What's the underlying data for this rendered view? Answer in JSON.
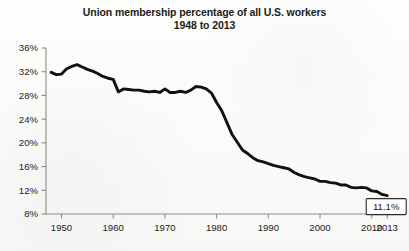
{
  "chart_data": {
    "type": "line",
    "title": "Union membership percentage of all U.S. workers",
    "subtitle": "1948 to 2013",
    "xlabel": "",
    "ylabel": "",
    "xlim": [
      1947,
      2013
    ],
    "ylim": [
      8,
      36
    ],
    "grid": false,
    "legend": "none",
    "line_color": "#111111",
    "x_ticks": [
      "1950",
      "1960",
      "1970",
      "1980",
      "1990",
      "2000",
      "2010",
      "2013"
    ],
    "x_tick_values": [
      1950,
      1960,
      1970,
      1980,
      1990,
      2000,
      2010,
      2013
    ],
    "y_ticks": [
      "8%",
      "12%",
      "16%",
      "20%",
      "24%",
      "28%",
      "32%",
      "36%"
    ],
    "y_tick_values": [
      8,
      12,
      16,
      20,
      24,
      28,
      32,
      36
    ],
    "annotation": {
      "label": "11.1%",
      "x": 2013,
      "y": 11.1
    },
    "x": [
      1948,
      1949,
      1950,
      1951,
      1952,
      1953,
      1954,
      1955,
      1956,
      1957,
      1958,
      1959,
      1960,
      1961,
      1962,
      1963,
      1964,
      1965,
      1966,
      1967,
      1968,
      1969,
      1970,
      1971,
      1972,
      1973,
      1974,
      1975,
      1976,
      1977,
      1978,
      1979,
      1980,
      1981,
      1982,
      1983,
      1984,
      1985,
      1986,
      1987,
      1988,
      1989,
      1990,
      1991,
      1992,
      1993,
      1994,
      1995,
      1996,
      1997,
      1998,
      1999,
      2000,
      2001,
      2002,
      2003,
      2004,
      2005,
      2006,
      2007,
      2008,
      2009,
      2010,
      2011,
      2012,
      2013
    ],
    "values": [
      31.9,
      31.5,
      31.6,
      32.5,
      32.9,
      33.2,
      32.8,
      32.4,
      32.1,
      31.7,
      31.2,
      30.9,
      30.7,
      28.6,
      29.1,
      29.0,
      28.9,
      28.9,
      28.7,
      28.6,
      28.7,
      28.5,
      29.1,
      28.5,
      28.5,
      28.7,
      28.5,
      28.9,
      29.5,
      29.4,
      29.1,
      28.4,
      26.8,
      25.4,
      23.4,
      21.4,
      20.1,
      18.8,
      18.2,
      17.5,
      17.0,
      16.8,
      16.5,
      16.2,
      16.0,
      15.8,
      15.6,
      15.0,
      14.6,
      14.3,
      14.1,
      13.9,
      13.5,
      13.5,
      13.3,
      13.2,
      12.9,
      12.9,
      12.5,
      12.4,
      12.5,
      12.4,
      11.9,
      11.8,
      11.3,
      11.1
    ]
  },
  "geometry": {
    "plot_left": 46,
    "plot_right": 395,
    "plot_top": 48,
    "plot_bottom": 214,
    "x_min": 1947,
    "x_max": 2014.5,
    "y_min": 8,
    "y_max": 36
  }
}
